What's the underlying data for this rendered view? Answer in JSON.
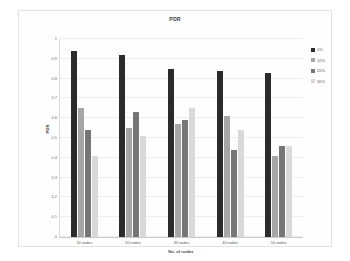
{
  "chart_data": {
    "type": "bar",
    "title": "PDR",
    "xlabel": "No. of nodes",
    "ylabel": "PDR",
    "categories": [
      "10 nodes",
      "20 nodes",
      "30 nodes",
      "40 nodes",
      "50 nodes"
    ],
    "ylim": [
      0,
      1
    ],
    "yticks": [
      "0",
      "0.1",
      "0.2",
      "0.3",
      "0.4",
      "0.5",
      "0.6",
      "0.7",
      "0.8",
      "0.9",
      "1"
    ],
    "grid": true,
    "legend_position": "right",
    "series": [
      {
        "name": "0%",
        "color": "#2b2b2b",
        "values": [
          0.94,
          0.92,
          0.85,
          0.84,
          0.83
        ]
      },
      {
        "name": "10%",
        "color": "#a6a6a6",
        "values": [
          0.65,
          0.55,
          0.57,
          0.61,
          0.41
        ]
      },
      {
        "name": "20%",
        "color": "#767676",
        "values": [
          0.54,
          0.63,
          0.59,
          0.44,
          0.46
        ]
      },
      {
        "name": "30%",
        "color": "#d9d9d9",
        "values": [
          0.41,
          0.51,
          0.65,
          0.54,
          0.46
        ]
      }
    ]
  },
  "style": {
    "background": "#ffffff",
    "frame_border": "#e3e3e3",
    "gridline": "#eeeeee",
    "axis": "#c9c9c9",
    "text": "#5a5a5a"
  }
}
